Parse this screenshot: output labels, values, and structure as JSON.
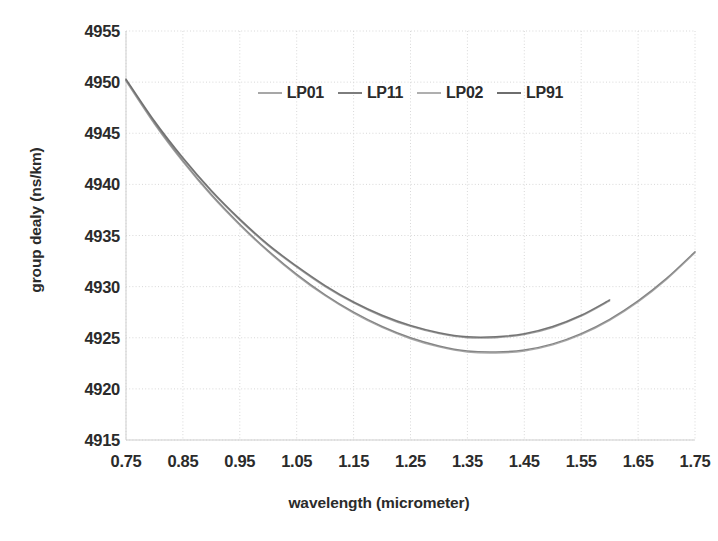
{
  "chart_data": {
    "type": "line",
    "title": "",
    "xlabel": "wavelength (micrometer)",
    "ylabel": "group dealy (ns/km)",
    "xlim": [
      0.75,
      1.75
    ],
    "ylim": [
      4915,
      4955
    ],
    "xticks": [
      "0.75",
      "0.85",
      "0.95",
      "1.05",
      "1.15",
      "1.25",
      "1.35",
      "1.45",
      "1.55",
      "1.65",
      "1.75"
    ],
    "yticks": [
      "4955",
      "4950",
      "4945",
      "4940",
      "4935",
      "4930",
      "4925",
      "4920",
      "4915"
    ],
    "grid": true,
    "legend_position": "top-center",
    "legend": [
      "LP01",
      "LP11",
      "LP02",
      "LP91"
    ],
    "x": [
      0.75,
      0.8,
      0.85,
      0.9,
      0.95,
      1.0,
      1.05,
      1.1,
      1.15,
      1.2,
      1.25,
      1.3,
      1.35,
      1.4,
      1.45,
      1.5,
      1.55,
      1.6,
      1.65,
      1.7,
      1.75
    ],
    "series": [
      {
        "name": "LP01",
        "color": "#8a8a8a",
        "values": [
          4950.2,
          4946.1,
          4942.5,
          4939.3,
          4936.5,
          4934.0,
          4931.9,
          4930.0,
          4928.4,
          4927.1,
          4926.1,
          4925.4,
          4925.0,
          4925.0,
          4925.3,
          4926.0,
          4927.1,
          4928.6,
          null,
          null,
          null
        ]
      },
      {
        "name": "LP11",
        "color": "#7d7d7d",
        "values": [
          4950.2,
          4946.0,
          4942.3,
          4939.0,
          4936.1,
          4933.5,
          4931.2,
          4929.2,
          4927.5,
          4926.1,
          4925.0,
          4924.2,
          4923.7,
          4923.6,
          4923.8,
          4924.4,
          4925.4,
          4926.8,
          4928.6,
          4930.8,
          4933.4
        ]
      },
      {
        "name": "LP02",
        "color": "#949494",
        "values": [
          4950.1,
          4945.9,
          4942.2,
          4938.9,
          4936.0,
          4933.4,
          4931.1,
          4929.1,
          4927.4,
          4926.0,
          4924.9,
          4924.1,
          4923.6,
          4923.5,
          4923.7,
          4924.3,
          4925.3,
          4926.7,
          4928.5,
          4930.7,
          4933.3
        ]
      },
      {
        "name": "LP91",
        "color": "#6e6e6e",
        "values": [
          4950.3,
          4946.2,
          4942.6,
          4939.4,
          4936.6,
          4934.1,
          4932.0,
          4930.1,
          4928.5,
          4927.2,
          4926.2,
          4925.5,
          4925.1,
          4925.1,
          4925.4,
          4926.1,
          4927.2,
          4928.7,
          null,
          null,
          null
        ]
      }
    ]
  },
  "axes": {
    "x_title": "wavelength (micrometer)",
    "y_title": "group dealy (ns/km)"
  },
  "legend_items": [
    {
      "label": "LP01"
    },
    {
      "label": "LP11"
    },
    {
      "label": "LP02"
    },
    {
      "label": "LP91"
    }
  ]
}
